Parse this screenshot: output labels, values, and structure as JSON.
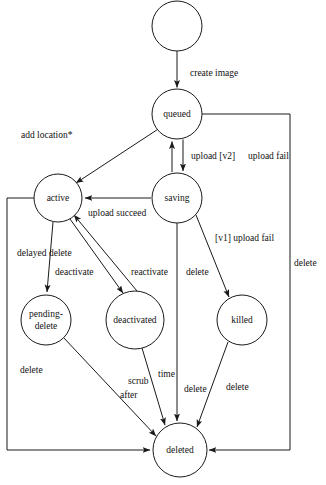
{
  "diagram": {
    "caption": "",
    "background_color": "#ffffff",
    "stroke_color": "#1a1a1a",
    "text_color": "#111111",
    "nodes": [
      {
        "id": "start",
        "label": "",
        "cx": 177,
        "cy": 26,
        "r": 25
      },
      {
        "id": "queued",
        "label": "queued",
        "cx": 177,
        "cy": 114,
        "r": 25
      },
      {
        "id": "active",
        "label": "active",
        "cx": 58,
        "cy": 198,
        "r": 24
      },
      {
        "id": "saving",
        "label": "saving",
        "cx": 177,
        "cy": 198,
        "r": 25
      },
      {
        "id": "pending",
        "label": "pending-\ndelete",
        "cx": 46,
        "cy": 320,
        "r": 25
      },
      {
        "id": "deactivated",
        "label": "deactivated",
        "cx": 135,
        "cy": 320,
        "r": 29
      },
      {
        "id": "killed",
        "label": "killed",
        "cx": 242,
        "cy": 320,
        "r": 25
      },
      {
        "id": "deleted",
        "label": "deleted",
        "cx": 180,
        "cy": 450,
        "r": 27
      }
    ],
    "edges": [
      {
        "id": "e-start-queued",
        "from": "start",
        "to": "queued",
        "label": "create image"
      },
      {
        "id": "e-queued-active",
        "from": "queued",
        "to": "active",
        "label": "add location*"
      },
      {
        "id": "e-queued-saving",
        "from": "queued",
        "to": "saving",
        "label": "upload [v2]"
      },
      {
        "id": "e-saving-queued",
        "from": "saving",
        "to": "queued",
        "label": "upload fail"
      },
      {
        "id": "e-saving-active",
        "from": "saving",
        "to": "active",
        "label": "upload succeed"
      },
      {
        "id": "e-saving-killed",
        "from": "saving",
        "to": "killed",
        "label": "[v1] upload fail"
      },
      {
        "id": "e-saving-deleted",
        "from": "saving",
        "to": "deleted",
        "label": "delete"
      },
      {
        "id": "e-active-pending",
        "from": "active",
        "to": "pending",
        "label": "delayed delete"
      },
      {
        "id": "e-active-deactivated",
        "from": "active",
        "to": "deactivated",
        "label": "deactivate"
      },
      {
        "id": "e-deactivated-active",
        "from": "deactivated",
        "to": "active",
        "label": "reactivate"
      },
      {
        "id": "e-active-deleted",
        "from": "active",
        "to": "deleted",
        "label": "delete"
      },
      {
        "id": "e-pending-deleted",
        "from": "pending",
        "to": "deleted",
        "label": "scrub after"
      },
      {
        "id": "e-deactivated-deleted",
        "from": "deactivated",
        "to": "deleted",
        "label": "time"
      },
      {
        "id": "e-killed-deleted",
        "from": "killed",
        "to": "deleted",
        "label": "delete"
      },
      {
        "id": "e-queued-deleted",
        "from": "queued",
        "to": "deleted",
        "label": "delete"
      }
    ],
    "edge_labels": [
      {
        "id": "lbl-create-image",
        "text": "create image",
        "x": 190,
        "y": 76,
        "anchor": "start"
      },
      {
        "id": "lbl-add-location",
        "text": "add location*",
        "x": 66,
        "y": 138,
        "anchor": "start"
      },
      {
        "id": "lbl-upload-v2",
        "text": "upload [v2]",
        "x": 191,
        "y": 156,
        "anchor": "start"
      },
      {
        "id": "lbl-upload-fail",
        "text": "upload fail",
        "x": 243,
        "y": 156,
        "anchor": "start"
      },
      {
        "id": "lbl-upload-succeed",
        "text": "upload succeed",
        "x": 88,
        "y": 216,
        "anchor": "start"
      },
      {
        "id": "lbl-v1-upload-fail",
        "text": "[v1] upload fail",
        "x": 215,
        "y": 238,
        "anchor": "start"
      },
      {
        "id": "lbl-delete-right",
        "text": "delete",
        "x": 296,
        "y": 263,
        "anchor": "start"
      },
      {
        "id": "lbl-delayed-delete",
        "text": "delayed delete",
        "x": 17,
        "y": 253,
        "anchor": "start"
      },
      {
        "id": "lbl-deactivate",
        "text": "deactivate",
        "x": 57,
        "y": 272,
        "anchor": "start"
      },
      {
        "id": "lbl-reactivate",
        "text": "reactivate",
        "x": 133,
        "y": 272,
        "anchor": "start"
      },
      {
        "id": "lbl-delete-saving",
        "text": "delete",
        "x": 188,
        "y": 272,
        "anchor": "start"
      },
      {
        "id": "lbl-delete-left",
        "text": "delete",
        "x": 20,
        "y": 370,
        "anchor": "start"
      },
      {
        "id": "lbl-scrub",
        "text": "scrub",
        "x": 130,
        "y": 381,
        "anchor": "start"
      },
      {
        "id": "lbl-time",
        "text": "time",
        "x": 160,
        "y": 374,
        "anchor": "start"
      },
      {
        "id": "lbl-after",
        "text": "after",
        "x": 122,
        "y": 395,
        "anchor": "start"
      },
      {
        "id": "lbl-delete-mid",
        "text": "delete",
        "x": 186,
        "y": 389,
        "anchor": "start"
      },
      {
        "id": "lbl-delete-killed",
        "text": "delete",
        "x": 228,
        "y": 387,
        "anchor": "start"
      }
    ]
  }
}
